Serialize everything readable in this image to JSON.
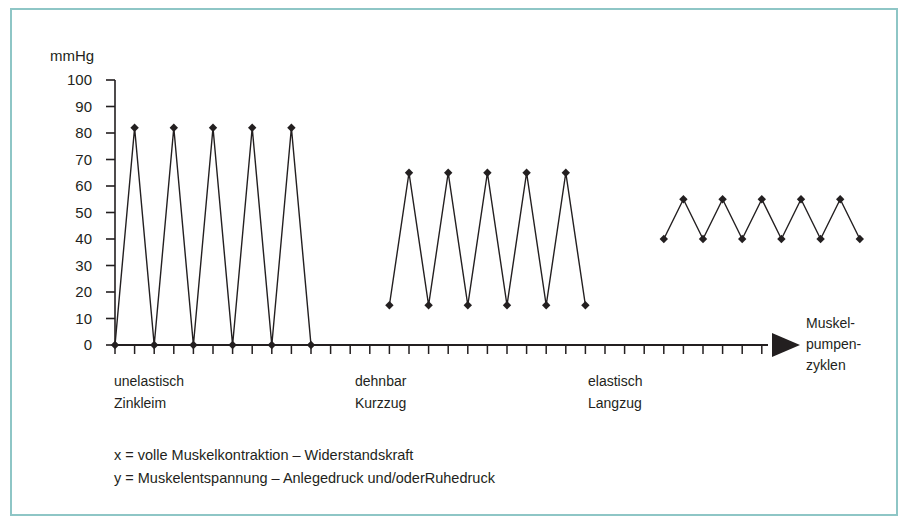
{
  "figure": {
    "y_axis_unit": "mmHg",
    "x_axis_label_lines": [
      "Muskel-",
      "pumpen-",
      "zyklen"
    ],
    "border_color": "#8ec6c6",
    "ink_color": "#231f20"
  },
  "legend": {
    "lines": [
      "x = volle Muskelkontraktion – Widerstandskraft",
      "y = Muskelentspannung – Anlegedruck und/oderRuhedruck"
    ]
  },
  "categories": [
    {
      "line1": "unelastisch",
      "line2": "Zinkleim"
    },
    {
      "line1": "dehnbar",
      "line2": "Kurzzug"
    },
    {
      "line1": "elastisch",
      "line2": "Langzug"
    }
  ],
  "chart_data": {
    "type": "line",
    "title": "",
    "xlabel": "Muskelpumpenzyklen",
    "ylabel": "mmHg",
    "ylim": [
      0,
      100
    ],
    "ytick_labels": [
      "100",
      "90",
      "80",
      "70",
      "60",
      "50",
      "40",
      "30",
      "20",
      "10",
      "0"
    ],
    "ytick_values": [
      100,
      90,
      80,
      70,
      60,
      50,
      40,
      30,
      20,
      10,
      0
    ],
    "grid": false,
    "legend_position": "none",
    "marker": "diamond",
    "series": [
      {
        "name": "unelastisch Zinkleim",
        "peak": 82,
        "trough": 0,
        "x": [
          0,
          1,
          2,
          3,
          4,
          5,
          6,
          7,
          8,
          9,
          10
        ],
        "values": [
          0,
          82,
          0,
          82,
          0,
          82,
          0,
          82,
          0,
          82,
          0
        ]
      },
      {
        "name": "dehnbar Kurzzug",
        "peak": 65,
        "trough": 15,
        "x": [
          14,
          15,
          16,
          17,
          18,
          19,
          20,
          21,
          22,
          23,
          24
        ],
        "values": [
          15,
          65,
          15,
          65,
          15,
          65,
          15,
          65,
          15,
          65,
          15
        ]
      },
      {
        "name": "elastisch Langzug",
        "peak": 55,
        "trough": 40,
        "x": [
          28,
          29,
          30,
          31,
          32,
          33,
          34,
          35,
          36,
          37,
          38
        ],
        "values": [
          40,
          55,
          40,
          55,
          40,
          55,
          40,
          55,
          40,
          55,
          40
        ]
      }
    ]
  }
}
